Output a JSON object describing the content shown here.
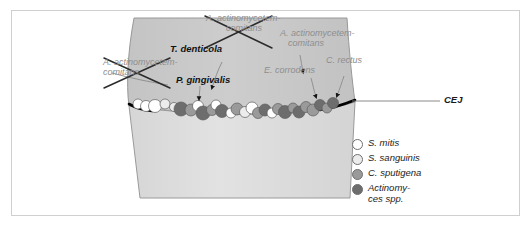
{
  "figure": {
    "type": "dental-plaque-biofilm-diagram"
  },
  "tooth": {
    "crown_label": "tooth-crown",
    "root_label": "tooth-root",
    "crown_color": "#c9c9c9",
    "root_color": "#dcdcdc",
    "outline_color": "#8d8d8d",
    "cej_line_color": "#000000"
  },
  "callouts": {
    "cej": {
      "text": "CEJ",
      "style": "black-italic"
    },
    "crossed_out": [
      {
        "id": "aa-top",
        "line1": "A. actinomycetem-",
        "line2": "comitans",
        "style": "gray-italic",
        "struck_through": true
      },
      {
        "id": "aa-left",
        "line1": "A. actinomycetem-",
        "line2": "comitans",
        "style": "gray-italic",
        "struck_through": true
      }
    ],
    "gray_labels": [
      {
        "id": "aa-right",
        "line1": "A. actinomycetem-",
        "line2": "comitans",
        "style": "gray-italic"
      },
      {
        "id": "e-corrodens",
        "line1": "E. corrodens",
        "line2": "",
        "style": "gray-italic"
      },
      {
        "id": "c-rectus",
        "line1": "C. rectus",
        "line2": "",
        "style": "gray-italic"
      }
    ],
    "black_labels": [
      {
        "id": "t-denticola",
        "text": "T. denticola",
        "style": "black-bold-italic"
      },
      {
        "id": "p-gingivalis",
        "text": "P. gingivalis",
        "style": "black-bold-italic"
      }
    ]
  },
  "legend": {
    "items": [
      {
        "id": "s-mitis",
        "label": "S. mitis",
        "label2": "",
        "color": "#ffffff"
      },
      {
        "id": "s-sanguinis",
        "label": "S. sanguinis",
        "label2": "",
        "color": "#ececec"
      },
      {
        "id": "c-sputigena",
        "label": "C. sputigena",
        "label2": "",
        "color": "#9a9a9a"
      },
      {
        "id": "actinomyces",
        "label": "Actinomy-",
        "label2": "ces spp.",
        "color": "#6d6d6d"
      }
    ]
  },
  "chart_data": {
    "type": "scatter",
    "legend_position": "right",
    "colony_colors": {
      "s_mitis": "#ffffff",
      "s_sanguinis": "#ececec",
      "c_sputigena": "#9a9a9a",
      "actinomyces": "#6d6d6d"
    },
    "colonies": [
      {
        "x": 138,
        "y": 104,
        "r": 5.0,
        "type": "s_mitis"
      },
      {
        "x": 146,
        "y": 106,
        "r": 5.5,
        "type": "s_mitis"
      },
      {
        "x": 155,
        "y": 106,
        "r": 6.5,
        "type": "s_mitis"
      },
      {
        "x": 165,
        "y": 104,
        "r": 5.0,
        "type": "s_sanguinis"
      },
      {
        "x": 174,
        "y": 107,
        "r": 4.5,
        "type": "s_sanguinis"
      },
      {
        "x": 181,
        "y": 109,
        "r": 7.0,
        "type": "actinomyces"
      },
      {
        "x": 191,
        "y": 110,
        "r": 6.0,
        "type": "c_sputigena"
      },
      {
        "x": 198,
        "y": 106,
        "r": 5.5,
        "type": "s_mitis"
      },
      {
        "x": 203,
        "y": 113,
        "r": 7.0,
        "type": "actinomyces"
      },
      {
        "x": 212,
        "y": 110,
        "r": 5.5,
        "type": "c_sputigena"
      },
      {
        "x": 216,
        "y": 105,
        "r": 5.0,
        "type": "s_mitis"
      },
      {
        "x": 222,
        "y": 111,
        "r": 6.5,
        "type": "actinomyces"
      },
      {
        "x": 231,
        "y": 113,
        "r": 5.0,
        "type": "s_mitis"
      },
      {
        "x": 237,
        "y": 109,
        "r": 6.0,
        "type": "c_sputigena"
      },
      {
        "x": 245,
        "y": 112,
        "r": 5.5,
        "type": "s_sanguinis"
      },
      {
        "x": 252,
        "y": 108,
        "r": 6.0,
        "type": "s_mitis"
      },
      {
        "x": 258,
        "y": 113,
        "r": 5.5,
        "type": "c_sputigena"
      },
      {
        "x": 265,
        "y": 110,
        "r": 6.0,
        "type": "actinomyces"
      },
      {
        "x": 272,
        "y": 113,
        "r": 5.0,
        "type": "s_mitis"
      },
      {
        "x": 278,
        "y": 109,
        "r": 5.5,
        "type": "c_sputigena"
      },
      {
        "x": 285,
        "y": 112,
        "r": 6.5,
        "type": "actinomyces"
      },
      {
        "x": 293,
        "y": 108,
        "r": 5.0,
        "type": "c_sputigena"
      },
      {
        "x": 299,
        "y": 112,
        "r": 6.0,
        "type": "actinomyces"
      },
      {
        "x": 306,
        "y": 107,
        "r": 5.5,
        "type": "c_sputigena"
      },
      {
        "x": 313,
        "y": 110,
        "r": 6.0,
        "type": "c_sputigena"
      },
      {
        "x": 320,
        "y": 105,
        "r": 5.5,
        "type": "actinomyces"
      },
      {
        "x": 327,
        "y": 108,
        "r": 5.0,
        "type": "c_sputigena"
      },
      {
        "x": 333,
        "y": 103,
        "r": 5.5,
        "type": "actinomyces"
      }
    ]
  }
}
